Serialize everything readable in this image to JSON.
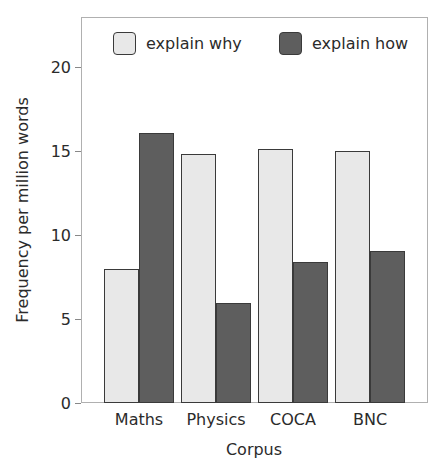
{
  "chart_data": {
    "type": "bar",
    "title": "",
    "xlabel": "Corpus",
    "ylabel": "Frequency per million words",
    "categories": [
      "Maths",
      "Physics",
      "COCA",
      "BNC"
    ],
    "series": [
      {
        "name": "explain why",
        "color": "#e8e8e8",
        "values": [
          8.0,
          14.8,
          15.1,
          15.0
        ]
      },
      {
        "name": "explain how",
        "color": "#5e5e5e",
        "values": [
          16.1,
          5.95,
          8.4,
          9.05
        ]
      }
    ],
    "ylim": [
      0,
      23
    ],
    "yticks": [
      0,
      5,
      10,
      15,
      20
    ],
    "grid": false,
    "legend_position": "top inside, horizontal"
  },
  "labels": {
    "xlabel": "Corpus",
    "ylabel": "Frequency per million words",
    "legend_why": "explain why",
    "legend_how": "explain how"
  }
}
